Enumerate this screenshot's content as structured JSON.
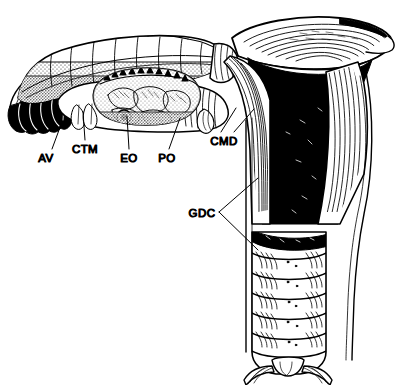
{
  "figure": {
    "type": "anatomical-line-drawing",
    "background_color": "#ffffff",
    "ink_color": "#000000"
  },
  "labels": [
    {
      "id": "AV",
      "text": "AV",
      "x": 46,
      "y": 158,
      "anchor": "middle"
    },
    {
      "id": "CTM",
      "text": "CTM",
      "x": 85,
      "y": 149,
      "anchor": "middle"
    },
    {
      "id": "EO",
      "text": "EO",
      "x": 129,
      "y": 158,
      "anchor": "middle"
    },
    {
      "id": "PO",
      "text": "PO",
      "x": 167,
      "y": 158,
      "anchor": "middle"
    },
    {
      "id": "CMD",
      "text": "CMD",
      "x": 224,
      "y": 141,
      "anchor": "middle"
    },
    {
      "id": "GDC",
      "text": "GDC",
      "x": 202,
      "y": 215,
      "anchor": "middle"
    }
  ],
  "leader_lines": [
    {
      "for": "AV",
      "points": "52,149 62,122"
    },
    {
      "for": "CTM",
      "points": "85,140 83,112"
    },
    {
      "for": "EO",
      "points": "129,149 127,116"
    },
    {
      "for": "PO",
      "points": "169,149 180,118"
    },
    {
      "for": "CMD",
      "points": "221,132 236,108"
    },
    {
      "for": "CMD2",
      "points": "234,132 254,109"
    },
    {
      "for": "GDC",
      "points": "219,212 258,178"
    },
    {
      "for": "GDC2",
      "points": "219,212 258,250"
    }
  ],
  "parts": [
    {
      "id": "AV",
      "name": "apical vesicles"
    },
    {
      "id": "CTM",
      "name": "connective tissue mantle"
    },
    {
      "id": "EO",
      "name": "ejaculatory organ"
    },
    {
      "id": "PO",
      "name": "prostatic organ"
    },
    {
      "id": "CMD",
      "name": "common muscular duct"
    },
    {
      "id": "GDC",
      "name": "genital duct chamber"
    }
  ]
}
